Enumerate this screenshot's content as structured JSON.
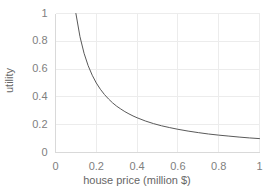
{
  "chart_data": {
    "type": "line",
    "title": "",
    "xlabel": "house price (million $)",
    "ylabel": "utility",
    "xlim": [
      0,
      1
    ],
    "ylim": [
      0,
      1
    ],
    "xticks": [
      "0",
      "0.2",
      "0.4",
      "0.6",
      "0.8",
      "1"
    ],
    "yticks": [
      "0",
      "0.2",
      "0.4",
      "0.6",
      "0.8",
      "1"
    ],
    "xtick_values": [
      0,
      0.2,
      0.4,
      0.6,
      0.8,
      1
    ],
    "ytick_values": [
      0,
      0.2,
      0.4,
      0.6,
      0.8,
      1
    ],
    "grid": true,
    "legend": "none",
    "series": [
      {
        "name": "utility",
        "x": [
          0.1,
          0.12,
          0.14,
          0.16,
          0.18,
          0.2,
          0.22,
          0.24,
          0.26,
          0.28,
          0.3,
          0.32,
          0.34,
          0.36,
          0.38,
          0.4,
          0.44,
          0.48,
          0.52,
          0.56,
          0.6,
          0.65,
          0.7,
          0.75,
          0.8,
          0.85,
          0.9,
          0.95,
          1.0
        ],
        "y": [
          1.0,
          0.833,
          0.714,
          0.625,
          0.556,
          0.5,
          0.455,
          0.417,
          0.385,
          0.357,
          0.333,
          0.313,
          0.294,
          0.278,
          0.263,
          0.25,
          0.227,
          0.208,
          0.192,
          0.179,
          0.167,
          0.154,
          0.143,
          0.133,
          0.125,
          0.118,
          0.111,
          0.105,
          0.1
        ]
      }
    ]
  },
  "style": {
    "line_color": "#595959",
    "grid_color": "#ececec",
    "axis_color": "#d9d9d9",
    "tick_text_color": "#808080",
    "title_text_color": "#666666",
    "background": "#ffffff"
  }
}
